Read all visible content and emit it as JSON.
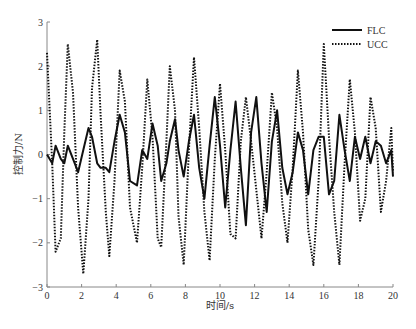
{
  "chart_data": {
    "type": "line",
    "title": "",
    "xlabel": "时间/s",
    "ylabel": "控制力/N",
    "xlim": [
      0,
      20
    ],
    "ylim": [
      -3,
      3
    ],
    "xticks": [
      0,
      2,
      4,
      6,
      8,
      10,
      12,
      14,
      16,
      18,
      20
    ],
    "yticks": [
      -3,
      -2,
      -1,
      0,
      1,
      2,
      3
    ],
    "grid": false,
    "legend_position": "top-right",
    "series": [
      {
        "name": "FLC",
        "style": "solid",
        "x": [
          0,
          0.3,
          0.5,
          0.8,
          1.0,
          1.2,
          1.5,
          1.8,
          2.1,
          2.4,
          2.6,
          2.9,
          3.1,
          3.4,
          3.6,
          3.9,
          4.2,
          4.5,
          4.8,
          5.2,
          5.5,
          5.8,
          6.1,
          6.4,
          6.6,
          6.9,
          7.1,
          7.4,
          7.6,
          7.9,
          8.2,
          8.5,
          8.8,
          9.1,
          9.4,
          9.7,
          10.0,
          10.3,
          10.6,
          10.9,
          11.2,
          11.5,
          11.8,
          12.1,
          12.4,
          12.7,
          13.0,
          13.3,
          13.6,
          13.9,
          14.2,
          14.5,
          14.8,
          15.1,
          15.4,
          15.7,
          16.0,
          16.3,
          16.6,
          16.9,
          17.2,
          17.5,
          17.8,
          18.1,
          18.4,
          18.7,
          19.0,
          19.3,
          19.6,
          19.9,
          20.0
        ],
        "values": [
          0,
          -0.2,
          0.2,
          -0.1,
          -0.2,
          0.2,
          -0.1,
          -0.4,
          0.1,
          0.6,
          0.4,
          -0.2,
          -0.3,
          -0.3,
          -0.4,
          0.3,
          0.9,
          0.5,
          -0.6,
          -0.7,
          0.1,
          -0.1,
          0.7,
          0.2,
          -0.6,
          -0.2,
          0.3,
          0.8,
          0.1,
          -0.5,
          0.3,
          0.9,
          -0.3,
          -1.0,
          0.2,
          1.3,
          0.2,
          -1.2,
          0.1,
          1.2,
          -0.3,
          -1.6,
          0.5,
          1.3,
          -0.2,
          -1.3,
          0.3,
          1.0,
          -0.3,
          -0.9,
          -0.4,
          0.5,
          0.1,
          -0.9,
          0.1,
          0.4,
          0.4,
          -0.9,
          -0.6,
          0.9,
          0.1,
          -0.6,
          0.4,
          -0.1,
          0.4,
          -0.2,
          0.3,
          0.2,
          -0.2,
          0.1,
          -0.5
        ]
      },
      {
        "name": "UCC",
        "style": "dotted",
        "x": [
          0,
          0.3,
          0.5,
          0.8,
          1.0,
          1.2,
          1.5,
          1.8,
          2.1,
          2.4,
          2.6,
          2.9,
          3.1,
          3.4,
          3.6,
          3.9,
          4.2,
          4.5,
          4.8,
          5.2,
          5.5,
          5.8,
          6.1,
          6.4,
          6.6,
          6.9,
          7.1,
          7.4,
          7.6,
          7.9,
          8.2,
          8.5,
          8.8,
          9.1,
          9.4,
          9.7,
          10.0,
          10.3,
          10.6,
          10.9,
          11.2,
          11.5,
          11.8,
          12.1,
          12.4,
          12.7,
          13.0,
          13.3,
          13.6,
          13.9,
          14.2,
          14.5,
          14.8,
          15.1,
          15.4,
          15.7,
          16.0,
          16.3,
          16.6,
          16.9,
          17.2,
          17.5,
          17.8,
          18.1,
          18.4,
          18.7,
          19.0,
          19.3,
          19.6,
          19.9,
          20.0
        ],
        "values": [
          2.3,
          -0.2,
          -2.2,
          -1.9,
          0.5,
          2.5,
          1.4,
          -1.2,
          -2.7,
          -1.0,
          1.5,
          2.6,
          0.9,
          -1.3,
          -2.3,
          -0.6,
          1.9,
          1.2,
          -1.2,
          -2.0,
          -0.3,
          1.7,
          0.4,
          -1.9,
          -2.1,
          0.3,
          2.0,
          1.0,
          -1.4,
          -2.5,
          0.1,
          2.2,
          0.6,
          -1.3,
          -2.4,
          -0.1,
          1.6,
          0.1,
          -1.8,
          -1.9,
          0.3,
          1.3,
          0.3,
          -0.8,
          -1.9,
          -0.4,
          1.4,
          0.6,
          -1.1,
          -2.0,
          -0.3,
          1.9,
          0.5,
          -1.7,
          -2.5,
          -0.6,
          2.5,
          0.4,
          -1.3,
          -2.5,
          -0.2,
          1.7,
          0.5,
          -1.5,
          -1.0,
          1.3,
          0.6,
          -1.3,
          -0.6,
          0.6,
          -0.4
        ]
      }
    ]
  },
  "axes": {
    "xlabel": "时间/s",
    "ylabel": "控制力/N"
  },
  "legend": [
    {
      "label": "FLC",
      "style": "solid"
    },
    {
      "label": "UCC",
      "style": "dotted"
    }
  ],
  "caption": "图"
}
